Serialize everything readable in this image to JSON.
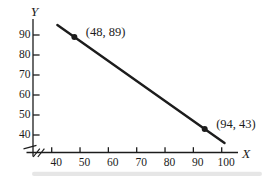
{
  "figure": {
    "background": "#ffffff",
    "ink_color": "#1c1c1c"
  },
  "chart_data": {
    "type": "line",
    "title": "",
    "xlabel": "X",
    "ylabel": "Y",
    "x_ticks": [
      40,
      50,
      60,
      70,
      80,
      90,
      100
    ],
    "y_ticks": [
      90,
      80,
      70,
      60,
      50,
      40
    ],
    "xlim": [
      40,
      100
    ],
    "ylim": [
      40,
      90
    ],
    "grid": false,
    "axis_break_x": true,
    "axis_break_y": true,
    "line_extent": {
      "x1": 42,
      "y1": 95,
      "x2": 101,
      "y2": 36
    },
    "points": [
      {
        "x": 48,
        "y": 89,
        "label": "(48, 89)"
      },
      {
        "x": 94,
        "y": 43,
        "label": "(94, 43)"
      }
    ]
  }
}
